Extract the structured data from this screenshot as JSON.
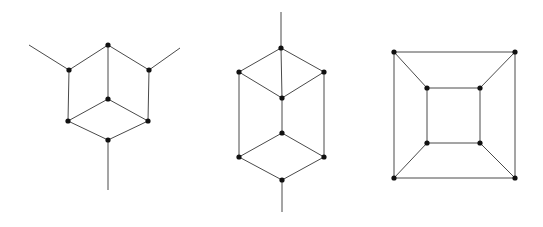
{
  "figure": {
    "background_color": "#ffffff",
    "edge_color": "#4a4a4a",
    "node_color": "#111111",
    "node_radius": 2.6,
    "edge_width": 1,
    "width": 543,
    "height": 227,
    "panels": [
      {
        "name": "left-graph",
        "label": "hexagonal-cube-graph-with-three-pendant-edges",
        "node_count": 7,
        "edge_count": 9,
        "nodes": [
          {
            "id": "t",
            "x": 108,
            "y": 45
          },
          {
            "id": "ul",
            "x": 69,
            "y": 70
          },
          {
            "id": "ur",
            "x": 149,
            "y": 70
          },
          {
            "id": "c",
            "x": 108,
            "y": 99
          },
          {
            "id": "ll",
            "x": 68,
            "y": 121
          },
          {
            "id": "lr",
            "x": 148,
            "y": 121
          },
          {
            "id": "b",
            "x": 108,
            "y": 140
          }
        ],
        "edges": [
          [
            "t",
            "ul"
          ],
          [
            "t",
            "ur"
          ],
          [
            "t",
            "c"
          ],
          [
            "ul",
            "ll"
          ],
          [
            "ur",
            "lr"
          ],
          [
            "c",
            "ll"
          ],
          [
            "c",
            "lr"
          ],
          [
            "ll",
            "b"
          ],
          [
            "lr",
            "b"
          ]
        ],
        "pendants": [
          {
            "from": "ul",
            "x2": 29,
            "y2": 45
          },
          {
            "from": "ur",
            "x2": 180,
            "y2": 48
          },
          {
            "from": "b",
            "x2": 108,
            "y2": 190
          }
        ]
      },
      {
        "name": "middle-graph",
        "label": "elongated-cube-graph-with-two-pendant-edges",
        "node_count": 8,
        "edge_count": 10,
        "nodes": [
          {
            "id": "t",
            "x": 281,
            "y": 48
          },
          {
            "id": "ul",
            "x": 239,
            "y": 72
          },
          {
            "id": "ur",
            "x": 324,
            "y": 72
          },
          {
            "id": "c1",
            "x": 282,
            "y": 98
          },
          {
            "id": "c2",
            "x": 282,
            "y": 133
          },
          {
            "id": "ll",
            "x": 239,
            "y": 157
          },
          {
            "id": "lr",
            "x": 324,
            "y": 157
          },
          {
            "id": "b",
            "x": 282,
            "y": 180
          }
        ],
        "edges": [
          [
            "t",
            "ul"
          ],
          [
            "t",
            "ur"
          ],
          [
            "t",
            "c1"
          ],
          [
            "ul",
            "c1"
          ],
          [
            "ur",
            "c1"
          ],
          [
            "c1",
            "c2"
          ],
          [
            "ul",
            "ll"
          ],
          [
            "ur",
            "lr"
          ],
          [
            "c2",
            "ll"
          ],
          [
            "c2",
            "lr"
          ],
          [
            "ll",
            "b"
          ],
          [
            "lr",
            "b"
          ]
        ],
        "pendants": [
          {
            "from": "t",
            "x2": 281,
            "y2": 12
          },
          {
            "from": "b",
            "x2": 282,
            "y2": 212
          }
        ]
      },
      {
        "name": "right-graph",
        "label": "nested-square-cube-graph",
        "node_count": 8,
        "edge_count": 12,
        "nodes": [
          {
            "id": "otl",
            "x": 394,
            "y": 52
          },
          {
            "id": "otr",
            "x": 515,
            "y": 52
          },
          {
            "id": "obl",
            "x": 394,
            "y": 178
          },
          {
            "id": "obr",
            "x": 515,
            "y": 178
          },
          {
            "id": "itl",
            "x": 427,
            "y": 88
          },
          {
            "id": "itr",
            "x": 480,
            "y": 88
          },
          {
            "id": "ibl",
            "x": 427,
            "y": 143
          },
          {
            "id": "ibr",
            "x": 480,
            "y": 143
          }
        ],
        "edges": [
          [
            "otl",
            "otr"
          ],
          [
            "otr",
            "obr"
          ],
          [
            "obr",
            "obl"
          ],
          [
            "obl",
            "otl"
          ],
          [
            "itl",
            "itr"
          ],
          [
            "itr",
            "ibr"
          ],
          [
            "ibr",
            "ibl"
          ],
          [
            "ibl",
            "itl"
          ],
          [
            "otl",
            "itl"
          ],
          [
            "otr",
            "itr"
          ],
          [
            "obl",
            "ibl"
          ],
          [
            "obr",
            "ibr"
          ]
        ],
        "pendants": []
      }
    ]
  }
}
